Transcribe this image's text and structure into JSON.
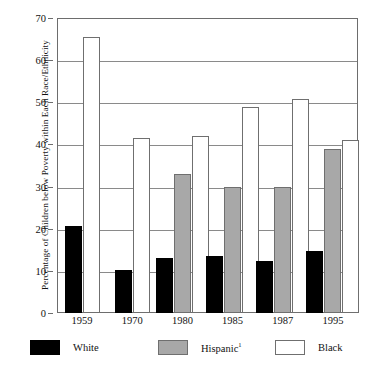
{
  "chart_data": {
    "type": "bar",
    "title": "",
    "xlabel": "",
    "ylabel": "Percentage of Children below Poverty within Each Race/Ethnicity",
    "ylim": [
      0,
      70
    ],
    "yticks": [
      0,
      10,
      20,
      30,
      40,
      50,
      60,
      70
    ],
    "grid": true,
    "legend_position": "bottom",
    "categories": [
      "1959",
      "1970",
      "1980",
      "1985",
      "1987",
      "1995"
    ],
    "series": [
      {
        "name": "White",
        "color": "#000000",
        "values": [
          20.6,
          10.2,
          13.0,
          13.6,
          12.4,
          14.7
        ]
      },
      {
        "name": "Hispanic¹",
        "color": "#a8a8a8",
        "values": [
          null,
          null,
          33.0,
          30.0,
          30.0,
          39.0
        ]
      },
      {
        "name": "Black",
        "color": "#ffffff",
        "values": [
          65.6,
          41.5,
          42.0,
          48.8,
          50.7,
          41.1
        ]
      }
    ]
  },
  "axis": {
    "y_title": "Percentage of Children below Poverty within Each Race/Ethnicity",
    "y_tick_labels": [
      "0",
      "10",
      "20",
      "30",
      "40",
      "50",
      "60",
      "70"
    ],
    "x_tick_labels": [
      "1959",
      "1970",
      "1980",
      "1985",
      "1987",
      "1995"
    ]
  },
  "legend": {
    "items": [
      {
        "label": "White",
        "superscript": ""
      },
      {
        "label": "Hispanic",
        "superscript": "1"
      },
      {
        "label": "Black",
        "superscript": ""
      }
    ]
  }
}
